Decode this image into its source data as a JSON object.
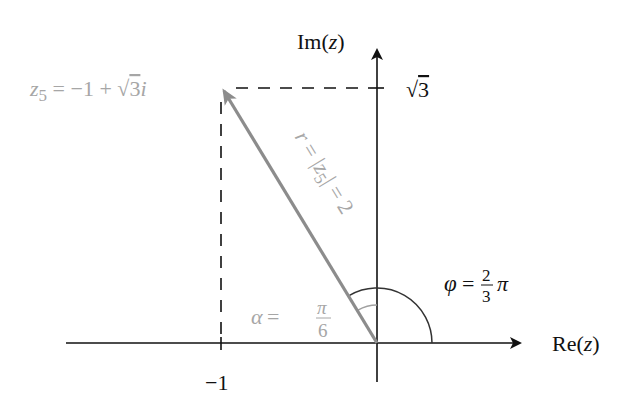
{
  "diagram": {
    "type": "complex-plane",
    "colors": {
      "axis": "#111111",
      "vector": "#8c8c8c",
      "vector_label": "#a6a6a6",
      "dashed": "#111111",
      "phi_arc": "#333333",
      "alpha_arc": "#a0a0a0"
    },
    "axes": {
      "x_label_prefix": "Re(",
      "x_label_var": "z",
      "x_label_suffix": ")",
      "y_label_prefix": "Im(",
      "y_label_var": "z",
      "y_label_suffix": ")"
    },
    "ticks": {
      "x_tick_label": "−1",
      "y_tick_label_root": "√",
      "y_tick_label_value": "3"
    },
    "point": {
      "name_var": "z",
      "name_sub": "5",
      "eq": " = −1 + ",
      "root": "√",
      "root_val": "3",
      "imag": "i",
      "re": -1,
      "im": 1.7320508
    },
    "vector_label": {
      "r": "r",
      "eq1": " = |",
      "z": "z",
      "sub": "5",
      "eq2": "| = 2"
    },
    "angles": {
      "phi_symbol": "φ",
      "phi_eq": " = ",
      "phi_num": "2",
      "phi_den": "3",
      "phi_pi": "π",
      "alpha_symbol": "α",
      "alpha_eq": " = ",
      "alpha_num": "π",
      "alpha_den": "6"
    }
  }
}
